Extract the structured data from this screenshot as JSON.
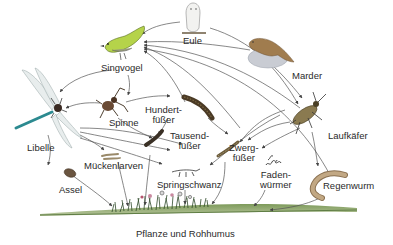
{
  "diagram": {
    "type": "food-web",
    "language": "de",
    "organisms": [
      {
        "id": "eule",
        "label": "Eule"
      },
      {
        "id": "marder",
        "label": "Marder"
      },
      {
        "id": "singvogel",
        "label": "Singvogel"
      },
      {
        "id": "libelle",
        "label": "Libelle"
      },
      {
        "id": "spinne",
        "label": "Spinne"
      },
      {
        "id": "hundertfuesser",
        "label": "Hundert-\nfüßer"
      },
      {
        "id": "tausendfuesser",
        "label": "Tausend-\nfüßer"
      },
      {
        "id": "laufkaefer",
        "label": "Laufkäfer"
      },
      {
        "id": "zwergfuesser",
        "label": "Zwerg-\nfüßer"
      },
      {
        "id": "fadenwuermer",
        "label": "Faden-\nwürmer"
      },
      {
        "id": "mueckenlarven",
        "label": "Mückenlarven"
      },
      {
        "id": "assel",
        "label": "Assel"
      },
      {
        "id": "springschwanz",
        "label": "Springschwanz"
      },
      {
        "id": "regenwurm",
        "label": "Regenwurm"
      },
      {
        "id": "pflanze",
        "label": "Pflanze und Rohhumus"
      }
    ],
    "arrows": [
      {
        "from": "eule",
        "to": "singvogel"
      },
      {
        "from": "marder",
        "to": "singvogel"
      },
      {
        "from": "marder",
        "to": "laufkaefer"
      },
      {
        "from": "eule",
        "to": "laufkaefer"
      },
      {
        "from": "laufkaefer",
        "to": "singvogel"
      },
      {
        "from": "zwergfuesser",
        "to": "singvogel"
      },
      {
        "from": "regenwurm",
        "to": "singvogel"
      },
      {
        "from": "hundertfuesser",
        "to": "singvogel"
      },
      {
        "from": "singvogel",
        "to": "libelle"
      },
      {
        "from": "singvogel",
        "to": "spinne"
      },
      {
        "from": "spinne",
        "to": "libelle"
      },
      {
        "from": "spinne",
        "to": "hundertfuesser"
      },
      {
        "from": "spinne",
        "to": "tausendfuesser"
      },
      {
        "from": "hundertfuesser",
        "to": "tausendfuesser"
      },
      {
        "from": "hundertfuesser",
        "to": "zwergfuesser"
      },
      {
        "from": "libelle",
        "to": "mueckenlarven"
      },
      {
        "from": "libelle",
        "to": "springschwanz"
      },
      {
        "from": "libelle",
        "to": "tausendfuesser"
      },
      {
        "from": "libelle",
        "to": "assel"
      },
      {
        "from": "laufkaefer",
        "to": "fadenwuermer"
      },
      {
        "from": "laufkaefer",
        "to": "zwergfuesser"
      },
      {
        "from": "laufkaefer",
        "to": "regenwurm"
      },
      {
        "from": "laufkaefer",
        "to": "springschwanz"
      },
      {
        "from": "assel",
        "to": "pflanze"
      },
      {
        "from": "mueckenlarven",
        "to": "pflanze"
      },
      {
        "from": "tausendfuesser",
        "to": "pflanze"
      },
      {
        "from": "springschwanz",
        "to": "pflanze"
      },
      {
        "from": "zwergfuesser",
        "to": "pflanze"
      },
      {
        "from": "fadenwuermer",
        "to": "pflanze"
      },
      {
        "from": "regenwurm",
        "to": "pflanze"
      }
    ]
  },
  "colors": {
    "arrow": "#555555",
    "text": "#2a2a2a",
    "bird_green": "#b5d34a",
    "marten_brown": "#a07c4e",
    "rock_gray": "#c9ccd3",
    "dragonfly_teal": "#2c8a90",
    "beetle_brown": "#7a6a45",
    "worm_tan": "#b79e7e",
    "ground_green": "#6b8a4a"
  }
}
